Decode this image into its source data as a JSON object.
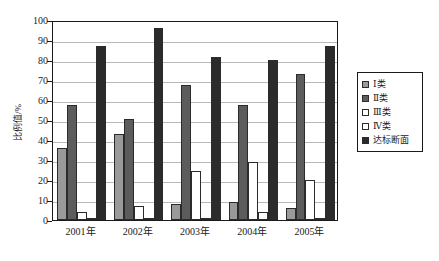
{
  "chart_data": {
    "type": "bar",
    "title": "",
    "subtitle": "",
    "xlabel": "",
    "ylabel": "比例值/%",
    "categories": [
      "2001年",
      "2002年",
      "2003年",
      "2004年",
      "2005年"
    ],
    "ylim": [
      0,
      100
    ],
    "yticks": [
      0,
      10,
      20,
      30,
      40,
      50,
      60,
      70,
      80,
      90,
      100
    ],
    "ytick_labels": [
      "0",
      "10",
      "20",
      "30",
      "40",
      "50",
      "60",
      "70",
      "80",
      "90",
      "100"
    ],
    "grid": true,
    "grid_axis": "y",
    "legend_position": "right",
    "series": [
      {
        "name": "Ⅰ类",
        "color": "#9a9a9a",
        "values": [
          36,
          43,
          8,
          9,
          6
        ]
      },
      {
        "name": "Ⅱ类",
        "color": "#5c5c5c",
        "values": [
          57.5,
          50.5,
          67.5,
          57.5,
          73
        ]
      },
      {
        "name": "Ⅲ类",
        "color": "#ffffff",
        "values": [
          4,
          7,
          24.5,
          29,
          20
        ]
      },
      {
        "name": "Ⅳ类",
        "color": "#ffffff",
        "values": [
          0.5,
          0.5,
          1,
          4,
          1
        ]
      },
      {
        "name": "达标断面",
        "color": "#2b2b2b",
        "values": [
          87,
          96,
          81.5,
          80,
          87
        ]
      }
    ]
  },
  "legend": {
    "entries": [
      {
        "label": "Ⅰ类",
        "color": "#9a9a9a"
      },
      {
        "label": "Ⅱ类",
        "color": "#5c5c5c"
      },
      {
        "label": "Ⅲ类",
        "color": "#ffffff"
      },
      {
        "label": "Ⅳ类",
        "color": "#ffffff"
      },
      {
        "label": "达标断面",
        "color": "#2b2b2b"
      }
    ]
  }
}
